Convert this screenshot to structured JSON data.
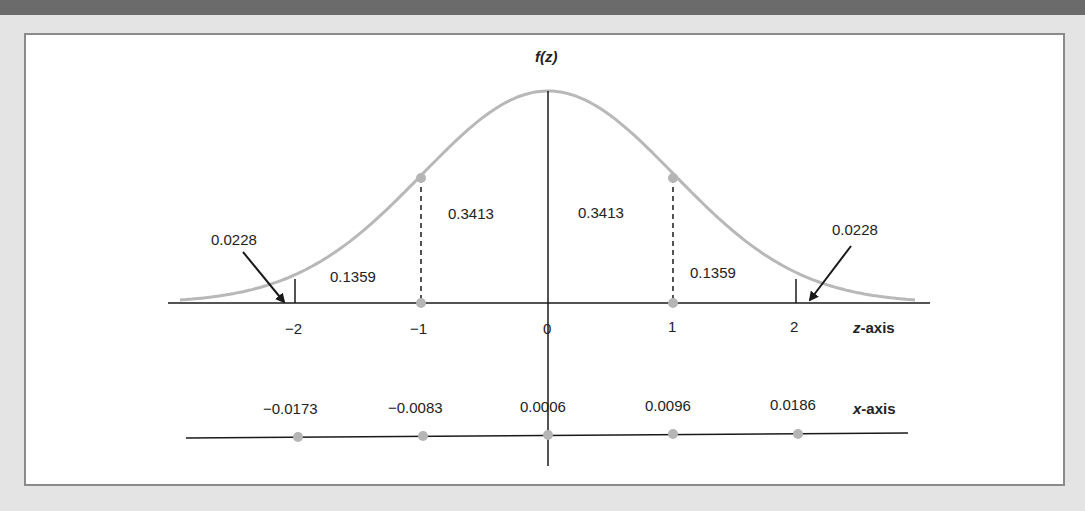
{
  "chart_data": {
    "type": "line",
    "title": "",
    "ylabel": "f(z)",
    "xlabel": "z-axis",
    "secondary_xlabel": "x-axis",
    "curve": "standard normal density",
    "z_ticks": [
      "−2",
      "−1",
      "0",
      "1",
      "2"
    ],
    "z_values": [
      -2,
      -1,
      0,
      1,
      2
    ],
    "x_ticks": [
      "−0.0173",
      "−0.0083",
      "0.0006",
      "0.0096",
      "0.0186"
    ],
    "x_values": [
      -0.0173,
      -0.0083,
      0.0006,
      0.0096,
      0.0186
    ],
    "areas": [
      {
        "region": "z < -2",
        "value": "0.0228"
      },
      {
        "region": "-2 < z < -1",
        "value": "0.1359"
      },
      {
        "region": "-1 < z < 0",
        "value": "0.3413"
      },
      {
        "region": "0 < z < 1",
        "value": "0.3413"
      },
      {
        "region": "1 < z < 2",
        "value": "0.1359"
      },
      {
        "region": "z > 2",
        "value": "0.0228"
      }
    ],
    "grid": false,
    "legend": "none"
  },
  "labels": {
    "fz": "f(z)",
    "z_axis": "-axis",
    "z_axis_var": "z",
    "x_axis": "-axis",
    "x_axis_var": "x",
    "tail_left": "0.0228",
    "tail_right": "0.0228",
    "band_left": "0.1359",
    "band_right": "0.1359",
    "center_left": "0.3413",
    "center_right": "0.3413",
    "z_tick_0": "−2",
    "z_tick_1": "−1",
    "z_tick_2": "0",
    "z_tick_3": "1",
    "z_tick_4": "2",
    "x_tick_0": "−0.0173",
    "x_tick_1": "−0.0083",
    "x_tick_2": "0.0006",
    "x_tick_3": "0.0096",
    "x_tick_4": "0.0186"
  },
  "colors": {
    "curve": "#b8b8b8",
    "axis": "#1a1a1a",
    "point": "#b5b5b5",
    "frame": "#8a8a8a",
    "top_bar": "#6b6b6b"
  }
}
